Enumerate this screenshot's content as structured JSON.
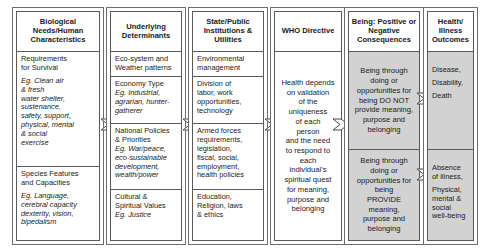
{
  "diagram": {
    "colors": {
      "shade": "#d2d2d2",
      "border": "#5a5a5a",
      "background": "#ffffff"
    },
    "columns": [
      {
        "id": "biological-needs",
        "header": "Biological Needs/Human Characteristics",
        "cells": [
          {
            "lines": [
              "Requirements",
              "for Survival"
            ],
            "eg": [
              "Eg. Clean air",
              "& fresh",
              "water shelter,",
              "sustenance,",
              "safety, support,",
              "physical, mental",
              "& social",
              "exercise"
            ],
            "shaded": false
          },
          {
            "lines": [
              "Species Features",
              "and Capacities"
            ],
            "eg": [
              "Eg. Language,",
              "cerebral capacity",
              "dexterity, vision,",
              "bipedalism"
            ],
            "shaded": false
          }
        ]
      },
      {
        "id": "underlying-determinants",
        "header": "Underlying Determinants",
        "cells": [
          {
            "lines": [
              "Eco-system and",
              "Weather patterns"
            ],
            "eg": [],
            "shaded": false
          },
          {
            "lines": [
              "Economy Type"
            ],
            "eg": [
              "Eg. Industrial,",
              "agrarian, hunter-",
              "gatherer"
            ],
            "shaded": false
          },
          {
            "lines": [
              "National Policies",
              "& Priorities"
            ],
            "eg": [
              "Eg. War/peace,",
              "eco-sustainable",
              "development,",
              "wealth/power"
            ],
            "shaded": false
          },
          {
            "lines": [
              "Cultural &",
              "Spiritual Values"
            ],
            "eg": [
              "Eg. Justice"
            ],
            "shaded": false
          }
        ]
      },
      {
        "id": "state-public-institutions",
        "header": "State/Public Institutions & Utilities",
        "cells": [
          {
            "lines": [
              "Environmental",
              "management"
            ],
            "eg": [],
            "shaded": false
          },
          {
            "lines": [
              "Division of",
              "labor, work",
              "opportunities,",
              "technology"
            ],
            "eg": [],
            "shaded": false
          },
          {
            "lines": [
              "Armed forces",
              "requirements,",
              "legislation,",
              "fiscal, social,",
              "employment,",
              "health policies"
            ],
            "eg": [],
            "shaded": false
          },
          {
            "lines": [
              "Education,",
              "Religion, laws",
              "& ethics"
            ],
            "eg": [],
            "shaded": false
          }
        ]
      },
      {
        "id": "who-directive",
        "header": "WHO Directive",
        "cells": [
          {
            "lines": [
              "Health depends",
              "on validation",
              "of the",
              "uniqueness",
              "of each",
              "person",
              "and the need",
              "to respond to",
              "each",
              "individual's",
              "spiritual quest",
              "for meaning,",
              "purpose and",
              "belonging"
            ],
            "eg": [],
            "shaded": false
          }
        ]
      },
      {
        "id": "being-consequences",
        "header": "Being: Positive or Negative Consequences",
        "cells": [
          {
            "lines": [
              "Being through",
              "doing or",
              "opportunities for",
              "being DO NOT",
              "provide meaning,",
              "purpose and",
              "belonging"
            ],
            "eg": [],
            "shaded": true
          },
          {
            "lines": [
              "Being through",
              "doing or",
              "opportunities for",
              "being",
              "PROVIDE",
              "meaning,",
              "purpose and",
              "belonging"
            ],
            "eg": [],
            "shaded": true
          }
        ]
      },
      {
        "id": "health-illness-outcomes",
        "header": "Health/ Illness Outcomes",
        "cells": [
          {
            "lines": [
              "Disease,",
              "",
              "Disability,",
              "",
              "Death"
            ],
            "eg": [],
            "shaded": true
          },
          {
            "lines": [
              "Absence",
              "of illness,",
              "",
              "Physical,",
              "mental &",
              "social",
              "well-being"
            ],
            "eg": [],
            "shaded": true
          }
        ]
      }
    ],
    "connectors": [
      {
        "id": "arrow-1-to-2",
        "label": "chevron-arrow-icon"
      },
      {
        "id": "arrow-2-to-3",
        "label": "chevron-arrow-icon"
      },
      {
        "id": "arrow-3-to-4",
        "label": "chevron-arrow-icon"
      },
      {
        "id": "arrow-4-to-5",
        "label": "chevron-arrow-icon"
      },
      {
        "id": "arrow-5-top-to-6",
        "label": "chevron-arrow-icon"
      },
      {
        "id": "arrow-5-bottom-to-6",
        "label": "chevron-arrow-icon"
      }
    ]
  }
}
